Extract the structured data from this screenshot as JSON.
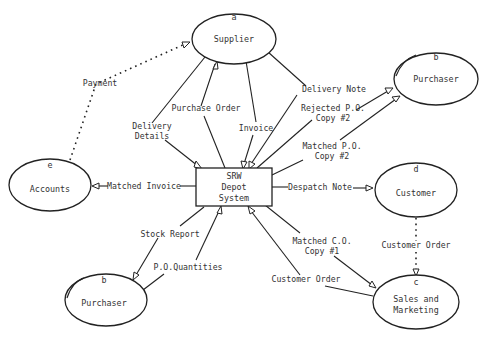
{
  "diagram": {
    "type": "data-flow-diagram",
    "central_process": {
      "id": "depot",
      "lines": [
        "SRW",
        "Depot",
        "System"
      ]
    },
    "entities": [
      {
        "id": "supplier",
        "letter": "a",
        "label": "Supplier"
      },
      {
        "id": "purchaser_top",
        "letter": "b",
        "label": "Purchaser"
      },
      {
        "id": "accounts",
        "letter": "e",
        "label": "Accounts"
      },
      {
        "id": "customer",
        "letter": "d",
        "label": "Customer"
      },
      {
        "id": "purchaser_bottom",
        "letter": "b",
        "label": "Purchaser"
      },
      {
        "id": "sales",
        "letter": "c",
        "label": [
          "Sales and",
          "Marketing"
        ]
      }
    ],
    "flows": [
      {
        "id": "payment",
        "label": "Payment",
        "from": "accounts",
        "to": "supplier",
        "style": "dotted"
      },
      {
        "id": "delivery_details",
        "label": [
          "Delivery",
          "Details"
        ],
        "from": "supplier",
        "to": "depot",
        "style": "solid"
      },
      {
        "id": "purchase_order",
        "label": "Purchase Order",
        "from": "depot",
        "to": "supplier",
        "style": "solid"
      },
      {
        "id": "invoice",
        "label": "Invoice",
        "from": "supplier",
        "to": "depot",
        "style": "solid"
      },
      {
        "id": "delivery_note",
        "label": "Delivery Note",
        "from": "supplier",
        "to": "depot",
        "style": "solid"
      },
      {
        "id": "rejected_po",
        "label": [
          "Rejected P.O.",
          "Copy #2"
        ],
        "from": "depot",
        "to": "purchaser_top",
        "style": "solid"
      },
      {
        "id": "matched_po",
        "label": [
          "Matched P.O.",
          "Copy #2"
        ],
        "from": "depot",
        "to": "purchaser_top",
        "style": "solid"
      },
      {
        "id": "matched_invoice",
        "label": "Matched Invoice",
        "from": "depot",
        "to": "accounts",
        "style": "solid"
      },
      {
        "id": "despatch_note",
        "label": "Despatch Note",
        "from": "depot",
        "to": "customer",
        "style": "solid"
      },
      {
        "id": "customer_order_dotted",
        "label": "Customer Order",
        "from": "customer",
        "to": "sales",
        "style": "dotted"
      },
      {
        "id": "stock_report",
        "label": "Stock Report",
        "from": "depot",
        "to": "purchaser_bottom",
        "style": "solid"
      },
      {
        "id": "po_quantities",
        "label": "P.O.Quantities",
        "from": "purchaser_bottom",
        "to": "depot",
        "style": "solid"
      },
      {
        "id": "matched_co",
        "label": [
          "Matched C.O.",
          "Copy #1"
        ],
        "from": "depot",
        "to": "sales",
        "style": "solid"
      },
      {
        "id": "customer_order",
        "label": "Customer Order",
        "from": "sales",
        "to": "depot",
        "style": "solid"
      }
    ]
  }
}
